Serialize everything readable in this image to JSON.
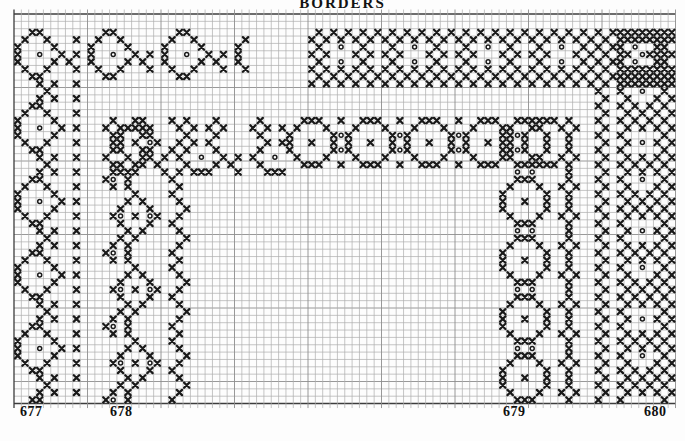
{
  "page": {
    "title": "BORDERS",
    "background": "#fdfdfd"
  },
  "colors": {
    "ink": "#1a1a1a",
    "grid_line": "#aeaeae",
    "grid_major": "#8d8d8d",
    "grid_edge": "#3d3d3d",
    "label": "#111111"
  },
  "chart": {
    "type": "cross-stitch-border-chart",
    "grid": {
      "origin_x": 14,
      "origin_y": 14,
      "cell": 7.35,
      "cols": 90,
      "rows": 53,
      "major_every": 10,
      "tick_overhang": 4.5
    },
    "symbols": {
      "X": "cross-stitch",
      "o": "eyelet-stitch"
    },
    "patterns": {
      "b677v": [
        "..XX.....",
        ".X..X...X",
        "X....X...",
        "X..o..X.X",
        "X....X...",
        ".X..X...X",
        "..XX.....",
        "...X.X..X",
        "....X....",
        "...X.X..X"
      ],
      "b677h": [
        "..XX......",
        ".X..X.....",
        "X....X....",
        "X..o..X.X.",
        "X....X.X..",
        ".X..X...X.",
        "..XX......",
        ".........."
      ],
      "b678v": [
        "....X....X..",
        "...X.X....X.",
        "..X...X....X",
        ".Xo.X.oX..X.",
        "..X...X..X..",
        "...X.X....X.",
        "..X.X......X",
        ".X.X......X.",
        "Xo.X.....X..",
        ".X.X......X."
      ],
      "b678h": [
        ".X...X....",
        "X.X.X.X...",
        ".X...X....",
        "..X.X.....",
        ".X...X....",
        "X..o..X.X.",
        ".X...X.X..",
        "..XXX...X."
      ],
      "b679v": [
        "..XXX....X.",
        ".X...X..X.X",
        "X.....X..X.",
        "X..X..X..X.",
        "X.....X..X.",
        ".X...X..X.X",
        "..XXX....X.",
        "..o.o....X."
      ],
      "b679h": [
        "..XXX..X",
        ".X...X..",
        "X.....Xo",
        "X..X..X.",
        "X.....Xo",
        ".X...X..",
        "..XXX..X",
        "........"
      ],
      "b680v": [
        "X..X.X.X.X.",
        ".X..X.X.X.X",
        "X..X.....X.",
        ".X..X.o.X.X",
        "X..X.....X.",
        ".X..X.X.X.X",
        "X..X.X.X.X.",
        ".X..X.X.X.X",
        "X..X..o..X.",
        ".X..X...X.X",
        "X..X.X.X.X.",
        ".X..X.X.X.X"
      ],
      "b680h": [
        ".X.X.X.X.X",
        "X.X.X.X.X.",
        ".X..o..X..",
        "X.X...X.X.",
        ".X..o..X..",
        "X.X.X.X.X.",
        ".X.X.X.X.X",
        "X.X.X.X.X."
      ]
    },
    "bands": [
      {
        "name": "design-677-top-arm",
        "pattern": "b677h",
        "col": 0,
        "row": 2,
        "w": 32,
        "h": 8
      },
      {
        "name": "design-677-left-arm",
        "pattern": "b677v",
        "col": 0,
        "row": 2,
        "w": 9,
        "h": 51
      },
      {
        "name": "design-678-top-arm",
        "pattern": "b678h",
        "col": 12,
        "row": 14,
        "w": 25,
        "h": 8
      },
      {
        "name": "design-678-left-arm",
        "pattern": "b678v",
        "col": 12,
        "row": 14,
        "w": 12,
        "h": 39
      },
      {
        "name": "design-679-top-arm",
        "pattern": "b679h",
        "col": 37,
        "row": 14,
        "w": 37,
        "h": 8
      },
      {
        "name": "design-679-right-arm",
        "pattern": "b679v",
        "col": 66,
        "row": 14,
        "w": 11,
        "h": 39
      },
      {
        "name": "design-680-top-arm",
        "pattern": "b680h",
        "col": 40,
        "row": 2,
        "w": 50,
        "h": 8
      },
      {
        "name": "design-680-right-arm",
        "pattern": "b680v",
        "col": 79,
        "row": 2,
        "w": 11,
        "h": 51
      }
    ],
    "design_numbers": [
      {
        "label": "677",
        "x": 20,
        "y": 404
      },
      {
        "label": "678",
        "x": 110,
        "y": 404
      },
      {
        "label": "679",
        "x": 503,
        "y": 404
      },
      {
        "label": "680",
        "x": 644,
        "y": 404
      }
    ]
  }
}
